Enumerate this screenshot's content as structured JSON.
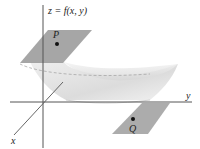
{
  "diagram": {
    "equation_label": "z = f(x, y)",
    "axes": {
      "x": "x",
      "y": "y"
    },
    "points": [
      {
        "name": "P",
        "position": "on upper tangent plane"
      },
      {
        "name": "Q",
        "position": "on lower tangent plane"
      }
    ],
    "colors": {
      "axis": "#555555",
      "plane": "#9a9a9a",
      "surface": "#e4e4e4",
      "surface_shadow": "#cfcfcf",
      "dash": "#999999",
      "point": "#111111"
    }
  }
}
